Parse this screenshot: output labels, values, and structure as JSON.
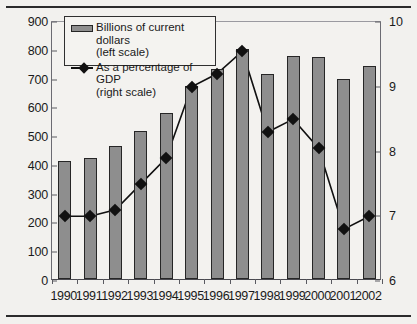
{
  "chart_data": {
    "type": "bar",
    "title": "",
    "xlabel": "",
    "ylabel": "",
    "grid": false,
    "legend_position": "top-left",
    "categories": [
      "1990",
      "1991",
      "1992",
      "1993",
      "1994",
      "1995",
      "1996",
      "1997",
      "1998",
      "1999",
      "2000",
      "2001",
      "2002"
    ],
    "series": [
      {
        "name": "Billions of current dollars (left scale)",
        "type": "bar",
        "axis": "left",
        "values": [
          410,
          420,
          462,
          515,
          578,
          672,
          730,
          800,
          712,
          775,
          772,
          695,
          740
        ]
      },
      {
        "name": "As a percentage of GDP (right scale)",
        "type": "line",
        "axis": "right",
        "values": [
          7.0,
          7.0,
          7.1,
          7.5,
          7.9,
          9.0,
          9.2,
          9.55,
          8.3,
          8.5,
          8.05,
          6.8,
          7.0
        ]
      }
    ],
    "left_axis": {
      "min": 0,
      "max": 900,
      "tick_step": 100,
      "ticks": [
        "0",
        "100",
        "200",
        "300",
        "400",
        "500",
        "600",
        "700",
        "800",
        "900"
      ]
    },
    "right_axis": {
      "min": 6,
      "max": 10,
      "tick_step": 1,
      "ticks": [
        "6",
        "7",
        "8",
        "9",
        "10"
      ]
    },
    "colors": {
      "bar_fill": "#8e8e8e",
      "bar_stroke": "#262626",
      "line": "#111111",
      "marker": "#111111",
      "background": "#f2f1ee",
      "axis": "#5a5a60"
    }
  },
  "legend": {
    "entries": [
      {
        "key": "bar-swatch",
        "line1": "Billions of current dollars",
        "line2": "(left scale)"
      },
      {
        "key": "line-marker",
        "line1": "As a percentage of GDP",
        "line2": "(right scale)"
      }
    ]
  }
}
